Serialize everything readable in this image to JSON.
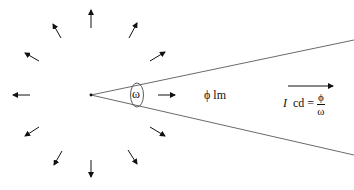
{
  "diagram": {
    "source_point": {
      "x": 91,
      "y": 95
    },
    "radiating_arrow_count": 12,
    "labels": {
      "solid_angle": "ω",
      "flux": "ϕ lm",
      "intensity_symbol": "I",
      "intensity_unit": "cd =",
      "fraction_numerator": "ϕ",
      "fraction_denominator": "ω"
    },
    "colors": {
      "line": "#333333",
      "arrow": "#111111",
      "background": "#ffffff"
    }
  }
}
